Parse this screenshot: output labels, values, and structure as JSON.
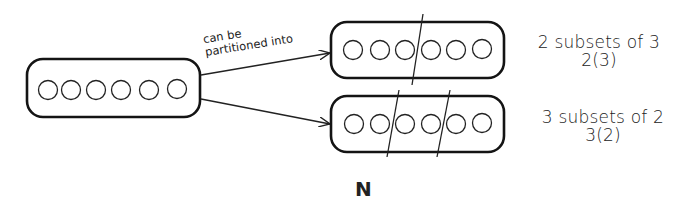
{
  "diagram": {
    "source_set": {
      "element_count": 6,
      "box": {
        "x": 27,
        "y": 58,
        "w": 173,
        "h": 60
      }
    },
    "arrow_label": {
      "line1": "can be",
      "line2": "partitioned into"
    },
    "partitions": [
      {
        "id": "top",
        "description": "2 subsets of 3",
        "notation": "2(3)",
        "subset_count": 2,
        "subset_size": 3,
        "element_count": 6,
        "box": {
          "x": 331,
          "y": 22,
          "w": 173,
          "h": 56
        }
      },
      {
        "id": "bottom",
        "description": "3 subsets of 2",
        "notation": "3(2)",
        "subset_count": 3,
        "subset_size": 2,
        "element_count": 6,
        "box": {
          "x": 331,
          "y": 96,
          "w": 173,
          "h": 56
        }
      }
    ],
    "caption": "N",
    "colors": {
      "ink": "#1a1a1a",
      "background": "#ffffff"
    }
  }
}
